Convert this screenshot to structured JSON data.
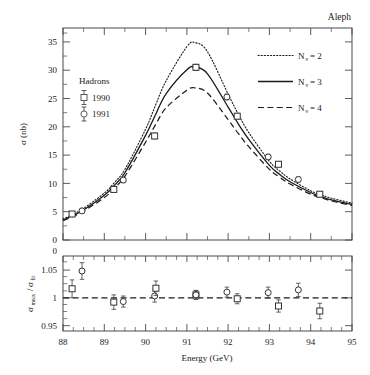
{
  "figure": {
    "experiment_label": "Aleph",
    "background_color": "#ffffff",
    "line_color": "#1a1a1a"
  },
  "chart_data": [
    {
      "type": "line",
      "panel": "main",
      "title": "",
      "xlabel": "",
      "ylabel": "σ (nb)",
      "xlim": [
        88,
        95
      ],
      "ylim": [
        0,
        37.5
      ],
      "xticks": [
        88,
        89,
        90,
        91,
        92,
        93,
        94,
        95
      ],
      "yticks": [
        0,
        5,
        10,
        15,
        20,
        25,
        30,
        35
      ],
      "grid": false,
      "legend_position": "upper-right",
      "series": [
        {
          "name": "Nν = 2",
          "style": "dotted",
          "x": [
            88.0,
            88.25,
            88.5,
            89.0,
            89.25,
            89.5,
            90.0,
            90.25,
            90.5,
            91.0,
            91.2,
            91.5,
            92.0,
            92.25,
            92.5,
            93.0,
            93.25,
            93.5,
            94.0,
            94.25,
            94.5,
            95.0
          ],
          "values": [
            3.7,
            4.6,
            5.6,
            8.3,
            10.2,
            12.5,
            19.6,
            24.0,
            28.2,
            34.2,
            34.9,
            33.3,
            25.8,
            22.2,
            19.0,
            13.9,
            12.2,
            10.8,
            8.7,
            8.0,
            7.4,
            6.5
          ]
        },
        {
          "name": "Nν = 3",
          "style": "solid",
          "x": [
            88.0,
            88.25,
            88.5,
            89.0,
            89.25,
            89.5,
            90.0,
            90.25,
            90.5,
            91.0,
            91.2,
            91.5,
            92.0,
            92.25,
            92.5,
            93.0,
            93.25,
            93.5,
            94.0,
            94.25,
            94.5,
            95.0
          ],
          "values": [
            3.5,
            4.4,
            5.3,
            7.9,
            9.7,
            11.9,
            18.5,
            22.3,
            25.9,
            30.1,
            30.6,
            29.4,
            23.5,
            20.5,
            17.8,
            13.2,
            11.6,
            10.3,
            8.4,
            7.7,
            7.1,
            6.3
          ]
        },
        {
          "name": "Nν = 4",
          "style": "dashed",
          "x": [
            88.0,
            88.25,
            88.5,
            89.0,
            89.25,
            89.5,
            90.0,
            90.25,
            90.5,
            91.0,
            91.2,
            91.5,
            92.0,
            92.25,
            92.5,
            93.0,
            93.25,
            93.5,
            94.0,
            94.25,
            94.5,
            95.0
          ],
          "values": [
            3.4,
            4.2,
            5.1,
            7.5,
            9.2,
            11.3,
            17.3,
            20.5,
            23.4,
            26.5,
            26.9,
            26.0,
            21.3,
            18.8,
            16.5,
            12.5,
            11.1,
            9.9,
            8.1,
            7.5,
            6.9,
            6.1
          ]
        }
      ],
      "points": [
        {
          "set": "1990",
          "marker": "square",
          "x": 88.22,
          "y": 4.6,
          "yerr": 0.45
        },
        {
          "set": "1991",
          "marker": "circle",
          "x": 88.46,
          "y": 5.15,
          "yerr": 0.45
        },
        {
          "set": "1990",
          "marker": "square",
          "x": 89.23,
          "y": 8.95,
          "yerr": 0.45
        },
        {
          "set": "1991",
          "marker": "circle",
          "x": 89.46,
          "y": 10.6,
          "yerr": 0.45
        },
        {
          "set": "1990",
          "marker": "square",
          "x": 90.22,
          "y": 18.4,
          "yerr": 0.5
        },
        {
          "set": "1991",
          "marker": "circle",
          "x": 91.22,
          "y": 30.55,
          "yerr": 0.5
        },
        {
          "set": "1990",
          "marker": "square",
          "x": 91.22,
          "y": 30.55,
          "yerr": 0.5
        },
        {
          "set": "1991",
          "marker": "circle",
          "x": 91.97,
          "y": 25.3,
          "yerr": 0.5
        },
        {
          "set": "1990",
          "marker": "square",
          "x": 92.22,
          "y": 21.9,
          "yerr": 0.5
        },
        {
          "set": "1991",
          "marker": "circle",
          "x": 92.97,
          "y": 14.7,
          "yerr": 0.45
        },
        {
          "set": "1990",
          "marker": "square",
          "x": 93.22,
          "y": 13.4,
          "yerr": 0.45
        },
        {
          "set": "1991",
          "marker": "circle",
          "x": 93.7,
          "y": 10.7,
          "yerr": 0.45
        },
        {
          "set": "1990",
          "marker": "square",
          "x": 94.22,
          "y": 8.1,
          "yerr": 0.45
        }
      ]
    },
    {
      "type": "scatter",
      "panel": "ratio",
      "title": "",
      "xlabel": "Energy (GeV)",
      "ylabel": "σ_meas/σ_fit",
      "xlim": [
        88,
        95
      ],
      "ylim": [
        0.935,
        1.07
      ],
      "xticks": [
        88,
        89,
        90,
        91,
        92,
        93,
        94,
        95
      ],
      "yticks": [
        0.95,
        1,
        1.05
      ],
      "grid": false,
      "reference_line": 1.0,
      "reference_style": "dashed",
      "points": [
        {
          "set": "1990",
          "marker": "square",
          "x": 88.22,
          "y": 1.011,
          "yerr": 0.016
        },
        {
          "set": "1991",
          "marker": "circle",
          "x": 88.46,
          "y": 1.043,
          "yerr": 0.015
        },
        {
          "set": "1990",
          "marker": "square",
          "x": 89.23,
          "y": 0.987,
          "yerr": 0.013
        },
        {
          "set": "1991",
          "marker": "circle",
          "x": 89.46,
          "y": 0.988,
          "yerr": 0.01
        },
        {
          "set": "1991",
          "marker": "circle",
          "x": 90.22,
          "y": 0.998,
          "yerr": 0.011
        },
        {
          "set": "1990",
          "marker": "square",
          "x": 90.25,
          "y": 1.012,
          "yerr": 0.013
        },
        {
          "set": "1990",
          "marker": "square",
          "x": 91.22,
          "y": 1.0,
          "yerr": 0.008
        },
        {
          "set": "1991",
          "marker": "circle",
          "x": 91.22,
          "y": 1.0,
          "yerr": 0.008
        },
        {
          "set": "1991",
          "marker": "circle",
          "x": 91.97,
          "y": 1.005,
          "yerr": 0.009
        },
        {
          "set": "1990",
          "marker": "square",
          "x": 92.22,
          "y": 0.993,
          "yerr": 0.009
        },
        {
          "set": "1991",
          "marker": "circle",
          "x": 92.97,
          "y": 1.004,
          "yerr": 0.01
        },
        {
          "set": "1990",
          "marker": "square",
          "x": 93.22,
          "y": 0.98,
          "yerr": 0.011
        },
        {
          "set": "1991",
          "marker": "circle",
          "x": 93.7,
          "y": 1.009,
          "yerr": 0.012
        },
        {
          "set": "1990",
          "marker": "square",
          "x": 94.22,
          "y": 0.971,
          "yerr": 0.014
        }
      ]
    }
  ],
  "main_panel": {
    "ylabel": "σ (nb)",
    "yticks": [
      "0",
      "5",
      "10",
      "15",
      "20",
      "25",
      "30",
      "35"
    ],
    "annotation_title": "Hadrons",
    "data_legend": [
      {
        "label": "1990",
        "marker": "square"
      },
      {
        "label": "1991",
        "marker": "circle"
      }
    ],
    "curve_legend": [
      {
        "symbol": "N",
        "subscript": "ν",
        "equals": "= 2",
        "style": "dotted"
      },
      {
        "symbol": "N",
        "subscript": "ν",
        "equals": "= 3",
        "style": "solid"
      },
      {
        "symbol": "N",
        "subscript": "ν",
        "equals": "= 4",
        "style": "dashed"
      }
    ]
  },
  "ratio_panel": {
    "ylabel_num": "σ",
    "ylabel_num_sub": "meas",
    "ylabel_den": "σ",
    "ylabel_den_sub": "fit",
    "yticks": [
      "1.05",
      "1",
      "0.95"
    ],
    "top_tick": "0"
  },
  "xaxis": {
    "label": "Energy (GeV)",
    "ticks": [
      "88",
      "89",
      "90",
      "91",
      "92",
      "93",
      "94",
      "95"
    ]
  }
}
